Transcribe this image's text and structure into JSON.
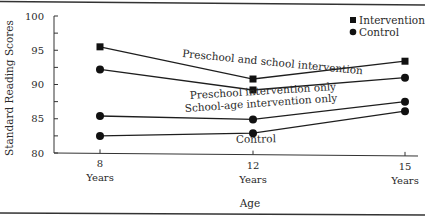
{
  "chart_data": {
    "type": "line",
    "title": "",
    "xlabel": "Age",
    "ylabel": "Standard Reading Scores",
    "x": [
      8,
      12,
      15
    ],
    "x_tick_labels": [
      {
        "value": "8",
        "unit": "Years"
      },
      {
        "value": "12",
        "unit": "Years"
      },
      {
        "value": "15",
        "unit": "Years"
      }
    ],
    "ylim": [
      80,
      100
    ],
    "y_ticks": [
      80,
      85,
      90,
      95,
      100
    ],
    "y_minor_ticks": [
      82.5,
      87.5,
      92.5,
      97.5
    ],
    "grid": false,
    "legend": {
      "placement": "top-right",
      "entries": [
        {
          "label": "Intervention",
          "marker": "square"
        },
        {
          "label": "Control",
          "marker": "circle"
        }
      ]
    },
    "series": [
      {
        "name": "Preschool and school intervention",
        "marker": "square",
        "values": [
          95.5,
          90.8,
          93.4
        ]
      },
      {
        "name": "Preschool intervention only",
        "marker": "square-circle",
        "markers": [
          "circle",
          "square",
          "circle"
        ],
        "values": [
          92.2,
          89.2,
          91.0
        ]
      },
      {
        "name": "School-age intervention only",
        "marker": "circle",
        "values": [
          85.4,
          84.9,
          87.5
        ]
      },
      {
        "name": "Control",
        "marker": "circle",
        "values": [
          82.5,
          82.9,
          86.1
        ]
      }
    ],
    "annotations": [
      "Preschool and school intervention",
      "Preschool intervention only",
      "School-age intervention only",
      "Control"
    ]
  }
}
